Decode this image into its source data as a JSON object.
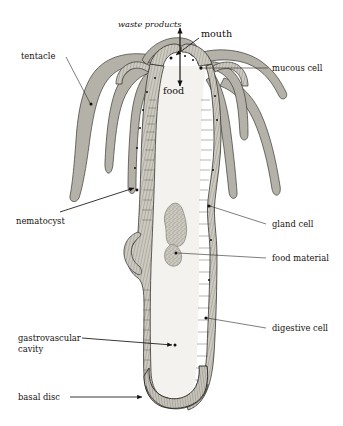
{
  "figure": {
    "background_color": "#ffffff",
    "ink_color": "#1a1a1a",
    "tentacle_fill": "#b4b2a8",
    "body_wall_fill": "#c9c7bd",
    "cavity_fill": "#f2f1ec",
    "food_fill": "#cbc9bf"
  },
  "labels": {
    "waste_products": "waste products",
    "mouth": "mouth",
    "food": "food",
    "tentacle": "tentacle",
    "mucous_cell": "mucous cell",
    "nematocyst": "nematocyst",
    "gland_cell": "gland cell",
    "food_material": "food material",
    "digestive_cell": "digestive cell",
    "gastrovascular_cavity_line1": "gastrovascular",
    "gastrovascular_cavity_line2": "cavity",
    "basal_disc": "basal disc"
  }
}
